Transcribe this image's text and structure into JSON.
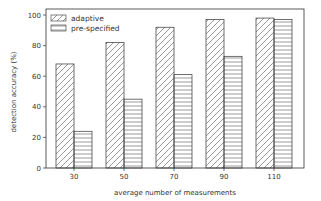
{
  "chart_data": {
    "type": "bar",
    "title": "",
    "xlabel": "average number of measurements",
    "ylabel": "detection accuracy (%)",
    "categories": [
      "30",
      "50",
      "70",
      "90",
      "110"
    ],
    "series": [
      {
        "name": "adaptive",
        "hatch": "diagonal",
        "values": [
          68,
          82,
          92,
          97,
          98
        ]
      },
      {
        "name": "pre-specified",
        "hatch": "horizontal",
        "values": [
          24,
          45,
          61,
          73,
          97
        ]
      }
    ],
    "ylim": [
      0,
      100
    ],
    "yticks": [
      0,
      20,
      40,
      60,
      80,
      100
    ],
    "grid": false,
    "legend_position": "upper left"
  },
  "colors": {
    "edge": "#333333",
    "hatch": "#555555",
    "background": "#ffffff"
  }
}
